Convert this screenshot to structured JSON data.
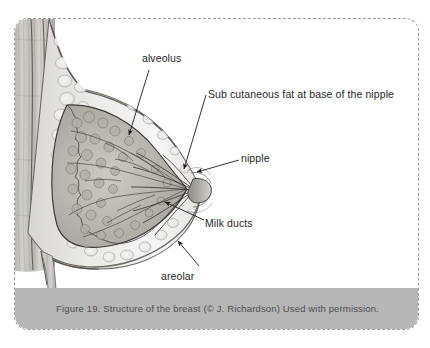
{
  "figure": {
    "title": "Structure of the breast",
    "caption": "Figure 19. Structure of the breast (© J. Richardson) Used with permission.",
    "caption_bar_color": "#b6b6b6",
    "frame_border_color": "#9a9a9a",
    "label_color": "#262626",
    "leader_color": "#1c1c1c"
  },
  "labels": {
    "alveolus": "alveolus",
    "subcutaneous_fat": "Sub cutaneous fat at base of the nipple",
    "nipple": "nipple",
    "milk_ducts": "Milk ducts",
    "areolar": "areolar"
  },
  "illustration": {
    "alt": "Lateral cross-section drawing of a human breast showing chest wall, fatty and glandular tissue, alveoli, milk ducts converging at the nipple, and the areolar region",
    "parts": [
      "chest-wall",
      "subcutaneous-fat",
      "glandular-tissue",
      "alveoli",
      "milk-ducts",
      "nipple",
      "areola"
    ]
  }
}
